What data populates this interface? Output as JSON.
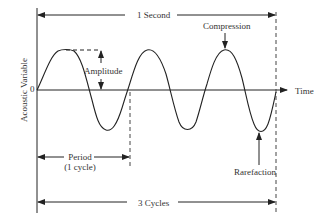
{
  "diagram": {
    "labels": {
      "one_second": "1 Second",
      "compression": "Compression",
      "amplitude": "Amplitude",
      "zero": "0",
      "time": "Time",
      "y_axis": "Acoustic   Variable",
      "period_line1": "Period",
      "period_line2": "(1 cycle)",
      "rarefaction": "Rarefaction",
      "three_cycles": "3 Cycles"
    },
    "wave": {
      "cycles": 3,
      "duration": "1 Second",
      "shape": "sine"
    },
    "colors": {
      "line": "#222222",
      "background": "#ffffff"
    }
  }
}
